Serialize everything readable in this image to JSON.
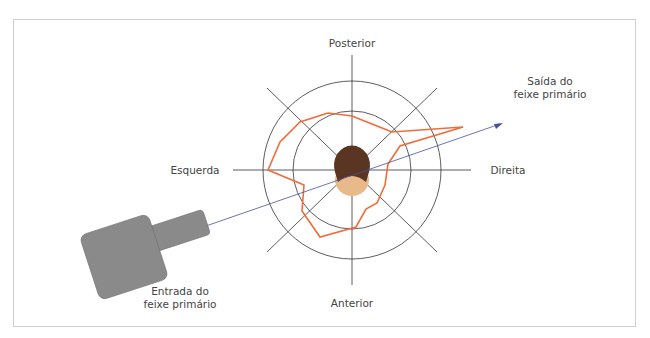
{
  "labels": {
    "posterior": "Posterior",
    "anterior": "Anterior",
    "left": "Esquerda",
    "right": "Direita",
    "beam_exit_line1": "Saída do",
    "beam_exit_line2": "feixe primário",
    "beam_entry_line1": "Entrada do",
    "beam_entry_line2": "feixe primário"
  },
  "colors": {
    "isodose": "#f26b3a",
    "beam": "#4a4fa0",
    "grid": "#333333",
    "hair": "#5a3522",
    "skin": "#e8b98a",
    "tube": "#8a8a8a"
  },
  "icons": {
    "head": "head-top-view-icon",
    "xray_tube": "xray-tube-icon"
  }
}
